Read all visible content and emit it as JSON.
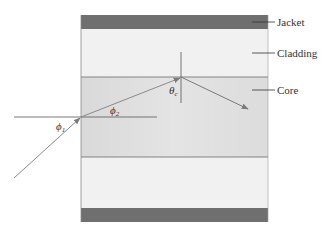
{
  "diagram": {
    "layers": [
      {
        "name": "Jacket",
        "color": "#6f6f6f"
      },
      {
        "name": "Cladding",
        "color": "#f1f1f1"
      },
      {
        "name": "Core",
        "color": "#dedede"
      }
    ],
    "labels": {
      "jacket": "Jacket",
      "cladding": "Cladding",
      "core": "Core"
    },
    "angles": {
      "phi1": "ϕ",
      "phi1_sub": "1",
      "phi2": "ϕ",
      "phi2_sub": "2",
      "theta_c": "θ",
      "theta_c_sub": "c"
    },
    "colors": {
      "ray": "#8a8a8a",
      "normal_line": "#555555",
      "boundary": "#6a6a6a",
      "text": "#333333"
    }
  }
}
